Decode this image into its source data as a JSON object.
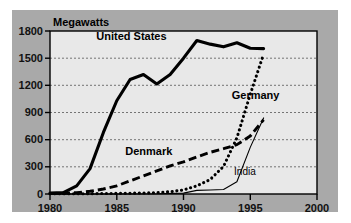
{
  "figure": {
    "panel_color": "#a9a9a9",
    "plot_bg_color": "#e8e8e8",
    "axis_color": "#000000",
    "grid_color": "#555555"
  },
  "chart_data": {
    "type": "line",
    "title": "",
    "ylabel": "Megawatts",
    "xlabel": "",
    "xlim": [
      1980,
      2000
    ],
    "ylim": [
      0,
      1800
    ],
    "xticks": [
      "1980",
      "1985",
      "1990",
      "1995",
      "2000"
    ],
    "yticks": [
      "0",
      "300",
      "600",
      "900",
      "1200",
      "1500",
      "1800"
    ],
    "grid": true,
    "legend_position": "inline-labels",
    "series": [
      {
        "name": "United States",
        "style": "solid-thick",
        "label_x": 1986.1,
        "label_y": 1700,
        "x": [
          1980,
          1981,
          1982,
          1983,
          1984,
          1985,
          1986,
          1987,
          1988,
          1989,
          1990,
          1991,
          1992,
          1993,
          1994,
          1995,
          1996
        ],
        "values": [
          10,
          15,
          90,
          280,
          680,
          1030,
          1265,
          1320,
          1215,
          1320,
          1500,
          1695,
          1655,
          1625,
          1670,
          1610,
          1605
        ]
      },
      {
        "name": "Germany",
        "style": "dotted",
        "label_x": 1995.4,
        "label_y": 1050,
        "x": [
          1980,
          1982,
          1984,
          1986,
          1988,
          1989,
          1990,
          1991,
          1992,
          1993,
          1994,
          1995,
          1996
        ],
        "values": [
          2,
          3,
          5,
          8,
          15,
          25,
          45,
          90,
          160,
          305,
          620,
          1100,
          1545
        ]
      },
      {
        "name": "Denmark",
        "style": "dashed",
        "label_x": 1987.4,
        "label_y": 430,
        "x": [
          1980,
          1981,
          1982,
          1983,
          1984,
          1985,
          1986,
          1987,
          1988,
          1989,
          1990,
          1991,
          1992,
          1993,
          1994,
          1995,
          1996
        ],
        "values": [
          5,
          8,
          15,
          30,
          55,
          90,
          145,
          200,
          255,
          310,
          355,
          410,
          460,
          500,
          545,
          640,
          820
        ]
      },
      {
        "name": "India",
        "style": "solid-thin",
        "label_x": 1994.6,
        "label_y": 215,
        "x": [
          1980,
          1985,
          1988,
          1990,
          1991,
          1992,
          1993,
          1994,
          1995,
          1996
        ],
        "values": [
          0,
          0,
          2,
          10,
          40,
          45,
          50,
          135,
          515,
          840
        ]
      }
    ]
  }
}
